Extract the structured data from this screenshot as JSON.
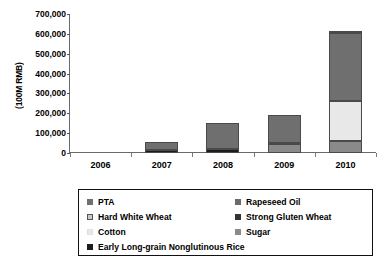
{
  "chart_data": {
    "type": "bar",
    "subtype": "stacked-column",
    "title": "",
    "xlabel": "",
    "ylabel": "(100M RMB)",
    "categories": [
      "2006",
      "2007",
      "2008",
      "2009",
      "2010"
    ],
    "ylim": [
      0,
      700000
    ],
    "yticks": [
      "0",
      "100,000",
      "200,000",
      "300,000",
      "400,000",
      "500,000",
      "600,000",
      "700,000"
    ],
    "ytick_values": [
      0,
      100000,
      200000,
      300000,
      400000,
      500000,
      600000,
      700000
    ],
    "grid": false,
    "legend_position": "bottom",
    "series": [
      {
        "name": "PTA",
        "color": "#6f6f6f",
        "values": [
          0,
          42000,
          130000,
          143000,
          345000
        ]
      },
      {
        "name": "Rapeseed Oil",
        "color": "#6a6a6a",
        "values": [
          0,
          0,
          0,
          0,
          0
        ]
      },
      {
        "name": "Hard White Wheat",
        "color": "#bdbdbd",
        "values": [
          0,
          0,
          0,
          0,
          0
        ]
      },
      {
        "name": "Strong Gluten Wheat",
        "color": "#333333",
        "values": [
          0,
          0,
          0,
          3000,
          0
        ]
      },
      {
        "name": "Cotton",
        "color": "#e8e8e8",
        "values": [
          0,
          0,
          0,
          0,
          202000
        ]
      },
      {
        "name": "Sugar",
        "color": "#8a8a8a",
        "values": [
          0,
          0,
          0,
          45000,
          58000
        ]
      },
      {
        "name": "Early Long-grain Nonglutinous Rice",
        "color": "#1c1c1c",
        "values": [
          0,
          13000,
          22000,
          0,
          7000
        ]
      }
    ],
    "totals": [
      0,
      55000,
      152000,
      191000,
      612000
    ],
    "stacks": [
      {
        "category": "2006",
        "segments": []
      },
      {
        "category": "2007",
        "segments": [
          {
            "name": "Early Long-grain Nonglutinous Rice",
            "value": 13000,
            "color": "#1c1c1c"
          },
          {
            "name": "PTA",
            "value": 42000,
            "color": "#6f6f6f"
          }
        ]
      },
      {
        "category": "2008",
        "segments": [
          {
            "name": "Early Long-grain Nonglutinous Rice",
            "value": 22000,
            "color": "#1c1c1c"
          },
          {
            "name": "PTA",
            "value": 130000,
            "color": "#6f6f6f"
          }
        ]
      },
      {
        "category": "2009",
        "segments": [
          {
            "name": "Sugar",
            "value": 45000,
            "color": "#8a8a8a"
          },
          {
            "name": "Strong Gluten Wheat",
            "value": 3000,
            "color": "#333333"
          },
          {
            "name": "PTA",
            "value": 143000,
            "color": "#6f6f6f"
          }
        ]
      },
      {
        "category": "2010",
        "segments": [
          {
            "name": "Sugar",
            "value": 58000,
            "color": "#8a8a8a"
          },
          {
            "name": "Cotton",
            "value": 202000,
            "color": "#e8e8e8"
          },
          {
            "name": "PTA",
            "value": 345000,
            "color": "#6f6f6f"
          },
          {
            "name": "Early Long-grain Nonglutinous Rice",
            "value": 7000,
            "color": "#1c1c1c"
          }
        ]
      }
    ]
  },
  "axis": {
    "y_label": "(100M RMB)",
    "y_ticks": [
      "700,000",
      "600,000",
      "500,000",
      "400,000",
      "300,000",
      "200,000",
      "100,000",
      "0"
    ],
    "x_ticks": [
      "2006",
      "2007",
      "2008",
      "2009",
      "2010"
    ]
  },
  "legend": {
    "items": [
      {
        "label": "PTA",
        "color": "#6f6f6f",
        "border": "#6f6f6f"
      },
      {
        "label": "Rapeseed Oil",
        "color": "#6a6a6a",
        "border": "#6a6a6a"
      },
      {
        "label": "Hard White Wheat",
        "color": "#c9c9c9",
        "border": "#555555"
      },
      {
        "label": "Strong Gluten Wheat",
        "color": "#333333",
        "border": "#333333"
      },
      {
        "label": "Cotton",
        "color": "#e8e8e8",
        "border": "#e0e0e0"
      },
      {
        "label": "Sugar",
        "color": "#8a8a8a",
        "border": "#8a8a8a"
      },
      {
        "label": "Early Long-grain Nonglutinous Rice",
        "color": "#1c1c1c",
        "border": "#1c1c1c"
      }
    ]
  },
  "colors": {
    "axis": "#6a6a6a",
    "text": "#000000",
    "legend_border": "#111111",
    "background": "#ffffff"
  }
}
